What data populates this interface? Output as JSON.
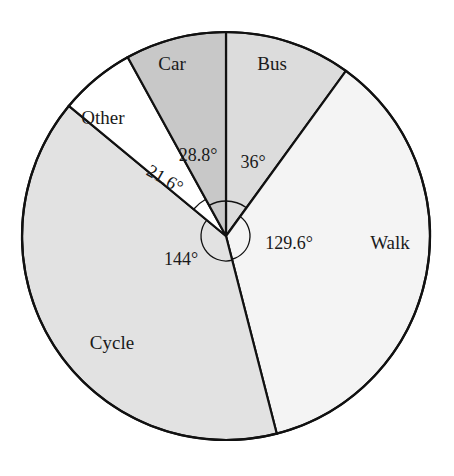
{
  "chart_data": {
    "type": "pie",
    "title": "",
    "start_angle_deg": 0,
    "direction": "clockwise",
    "unit": "degrees",
    "categories": [
      "Bus",
      "Walk",
      "Cycle",
      "Other",
      "Car"
    ],
    "values": [
      36,
      129.6,
      144,
      21.6,
      28.8
    ],
    "angle_labels": [
      "36°",
      "129.6°",
      "144°",
      "21.6°",
      "28.8°"
    ],
    "colors": [
      "#dcdcdc",
      "#f4f4f4",
      "#e2e2e2",
      "#ffffff",
      "#c8c8c8"
    ],
    "legend": "none (labels inside slices)",
    "total_degrees": 360
  },
  "labels": {
    "bus": "Bus",
    "walk": "Walk",
    "cycle": "Cycle",
    "other": "Other",
    "car": "Car",
    "bus_angle": "36°",
    "walk_angle": "129.6°",
    "cycle_angle": "144°",
    "other_angle": "21.6°",
    "car_angle": "28.8°"
  }
}
